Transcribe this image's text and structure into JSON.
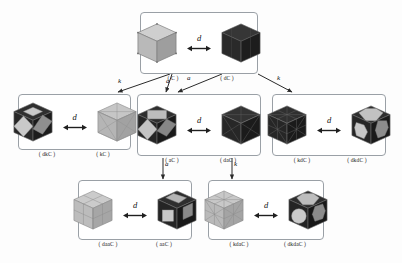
{
  "figure": {
    "dual_label": "d",
    "operator_kis": "k",
    "operator_ambo": "a",
    "colors": {
      "light_fill": "#b8b8b8",
      "light_top": "#cccccc",
      "light_side": "#a0a0a0",
      "dark_fill": "#2b2b2b",
      "dark_top": "#3a3a3a",
      "dark_side": "#1e1e1e",
      "edge": "#6b6b6b",
      "panel_border": "#9aa0a6",
      "background": "#fdfdfd",
      "text": "#111111"
    }
  },
  "panels": [
    {
      "id": "panel-top",
      "left": {
        "caption": "( C )",
        "shade": "light",
        "style": "plain-cube",
        "name": "cube-C"
      },
      "middle": {
        "label": "d"
      },
      "right": {
        "caption": "( dC )",
        "shade": "dark",
        "style": "plain-cube",
        "name": "cube-dC"
      }
    },
    {
      "id": "panel-mid-left",
      "left": {
        "caption": "( dkC )",
        "shade": "dark",
        "style": "diamond-face",
        "name": "cube-dkC"
      },
      "middle": {
        "label": "d"
      },
      "right": {
        "caption": "( kC )",
        "shade": "light",
        "style": "kis-wire",
        "name": "cube-kC"
      }
    },
    {
      "id": "panel-mid-center",
      "left": {
        "caption": "( aC )",
        "shade": "dark",
        "style": "ambo-diamond",
        "name": "cube-aC"
      },
      "middle": {
        "label": "d"
      },
      "right": {
        "caption": "( daC )",
        "shade": "dark",
        "style": "dual-ambo-wire",
        "name": "cube-daC"
      }
    },
    {
      "id": "panel-mid-right",
      "left": {
        "caption": "( kdC )",
        "shade": "dark",
        "style": "kis-dark-wire",
        "name": "cube-kdC"
      },
      "middle": {
        "label": "d"
      },
      "right": {
        "caption": "( dkdC )",
        "shade": "dark",
        "style": "octagon-face",
        "name": "cube-dkdC"
      }
    },
    {
      "id": "panel-bot-left",
      "left": {
        "caption": "( daaC )",
        "shade": "light",
        "style": "subdivided-cube",
        "name": "cube-daaC"
      },
      "middle": {
        "label": "d"
      },
      "right": {
        "caption": "( aaC )",
        "shade": "dark",
        "style": "square-face",
        "name": "cube-aaC"
      }
    },
    {
      "id": "panel-bot-right",
      "left": {
        "caption": "( kdaC )",
        "shade": "light",
        "style": "kis-light-wire",
        "name": "cube-kdaC"
      },
      "middle": {
        "label": "d"
      },
      "right": {
        "caption": "( dkdaC )",
        "shade": "dark",
        "style": "octagon-big-face",
        "name": "cube-dkdaC"
      }
    }
  ],
  "connectors": [
    {
      "id": "conn-top-to-midleft",
      "label": "k",
      "from": "panel-top",
      "to": "panel-mid-left"
    },
    {
      "id": "conn-top-to-midcenter-a1",
      "label": "a",
      "from": "panel-top",
      "to": "panel-mid-center"
    },
    {
      "id": "conn-top-to-midcenter-a2",
      "label": "a",
      "from": "panel-top",
      "to": "panel-mid-center"
    },
    {
      "id": "conn-top-to-midright",
      "label": "k",
      "from": "panel-top",
      "to": "panel-mid-right"
    },
    {
      "id": "conn-midcenter-to-botleft",
      "label": "a",
      "from": "panel-mid-center",
      "to": "panel-bot-left"
    },
    {
      "id": "conn-midcenter-to-botright",
      "label": "k",
      "from": "panel-mid-center",
      "to": "panel-bot-right"
    }
  ]
}
